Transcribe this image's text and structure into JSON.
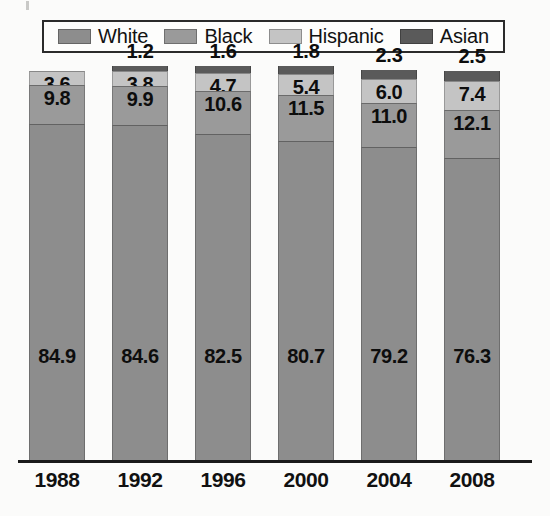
{
  "legend": {
    "items": [
      {
        "label": "White",
        "color": "#8d8d8d",
        "key": "white"
      },
      {
        "label": "Black",
        "color": "#9a9a9a",
        "key": "black"
      },
      {
        "label": "Hispanic",
        "color": "#c4c4c4",
        "key": "hispanic"
      },
      {
        "label": "Asian",
        "color": "#5a5a5a",
        "key": "asian"
      }
    ]
  },
  "chart_data": {
    "type": "bar",
    "stacked": true,
    "title": "",
    "xlabel": "",
    "ylabel": "",
    "ylim": [
      0,
      100
    ],
    "grid": false,
    "legend_position": "top",
    "categories": [
      "1988",
      "1992",
      "1996",
      "2000",
      "2004",
      "2008"
    ],
    "series": [
      {
        "name": "White",
        "color": "#8d8d8d",
        "values": [
          84.9,
          84.6,
          82.5,
          80.7,
          79.2,
          76.3
        ]
      },
      {
        "name": "Black",
        "color": "#9a9a9a",
        "values": [
          9.8,
          9.9,
          10.6,
          11.5,
          11.0,
          12.1
        ]
      },
      {
        "name": "Hispanic",
        "color": "#c4c4c4",
        "values": [
          3.6,
          3.8,
          4.7,
          5.4,
          6.0,
          7.4
        ]
      },
      {
        "name": "Asian",
        "color": "#5a5a5a",
        "values": [
          null,
          1.2,
          1.6,
          1.8,
          2.3,
          2.5
        ]
      }
    ],
    "labels": {
      "white": [
        "84.9",
        "84.6",
        "82.5",
        "80.7",
        "79.2",
        "76.3"
      ],
      "black": [
        "9.8",
        "9.9",
        "10.6",
        "11.5",
        "11.0",
        "12.1"
      ],
      "hispanic": [
        "3.6",
        "3.8",
        "4.7",
        "5.4",
        "6.0",
        "7.4"
      ],
      "asian": [
        "",
        "1.2",
        "1.6",
        "1.8",
        "2.3",
        "2.5"
      ]
    }
  },
  "axis": {
    "ticks": [
      "1988",
      "1992",
      "1996",
      "2000",
      "2004",
      "2008"
    ]
  }
}
